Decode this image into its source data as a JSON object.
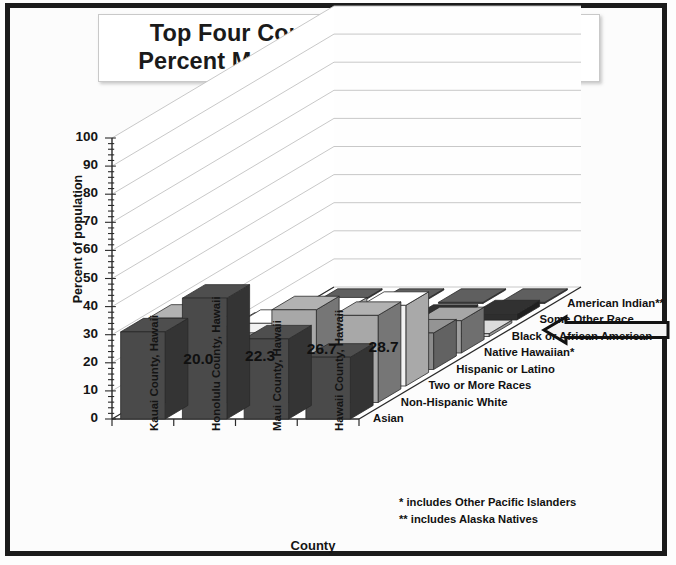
{
  "title": {
    "line1": "Top Four Counties with the Highest",
    "line2": "Percent Multi-Racial Population, 2015"
  },
  "axes": {
    "ylabel": "Percent of population",
    "xlabel": "County",
    "yticks": [
      "100",
      "90",
      "80",
      "70",
      "60",
      "50",
      "40",
      "30",
      "20",
      "10",
      "0"
    ]
  },
  "footnotes": {
    "line1": "* includes Other Pacific Islanders",
    "line2": "** includes Alaska Natives"
  },
  "annotation": {
    "arrow_name": "left-arrow-callout",
    "points_to": "Two or More Races"
  },
  "colors": {
    "frame": "#1b1b1b",
    "background": "#fcfcfc",
    "gridline": "#c2c2c2",
    "axis": "#2a2a2a",
    "text": "#111111"
  },
  "chart_data": {
    "type": "bar",
    "title": "Top Four Counties with the Highest Percent Multi-Racial Population, 2015",
    "xlabel": "County",
    "ylabel": "Percent of population",
    "ylim": [
      0,
      100
    ],
    "ytick_step": 10,
    "grid": true,
    "legend_position": "depth-axis-right",
    "projection": "3d",
    "categories": [
      "Kauai County, Hawaii",
      "Honolulu County, Hawaii",
      "Maui County, Hawaii",
      "Hawaii County, Hawaii"
    ],
    "series": [
      {
        "name": "Asian",
        "values": [
          31.0,
          43.0,
          28.5,
          22.0
        ],
        "shade": "#4a4a4a"
      },
      {
        "name": "Non-Hispanic White",
        "values": [
          30.0,
          20.0,
          33.0,
          31.0
        ],
        "shade": "#a8a8a8"
      },
      {
        "name": "Two or More Races",
        "values": [
          20.0,
          22.3,
          26.7,
          28.7
        ],
        "shade": "#f2f2f2",
        "data_labels": [
          "20.0",
          "22.3",
          "26.7",
          "28.7"
        ]
      },
      {
        "name": "Hispanic or Latino",
        "values": [
          10.5,
          10.0,
          11.0,
          13.0
        ],
        "shade": "#8c8c8c"
      },
      {
        "name": "Native Hawaiian*",
        "values": [
          9.5,
          9.0,
          10.5,
          11.5
        ],
        "shade": "#9e9e9e"
      },
      {
        "name": "Black or African American",
        "values": [
          1.0,
          3.0,
          1.0,
          1.0
        ],
        "shade": "#d0d0d0"
      },
      {
        "name": "Some Other Race",
        "values": [
          0.8,
          0.6,
          0.6,
          2.2
        ],
        "shade": "#2e2e2e"
      },
      {
        "name": "American Indian**",
        "values": [
          0.4,
          0.4,
          0.4,
          0.4
        ],
        "shade": "#5a5a5a"
      }
    ]
  }
}
